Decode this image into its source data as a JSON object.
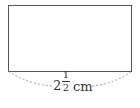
{
  "figure": {
    "shape": "rectangle",
    "label": {
      "whole": "2",
      "numerator": "1",
      "denominator": "2",
      "unit": "cm",
      "full_text": "2 1/2 cm"
    },
    "colors": {
      "stroke": "#555555",
      "dash": "#888888",
      "text": "#333333"
    }
  }
}
